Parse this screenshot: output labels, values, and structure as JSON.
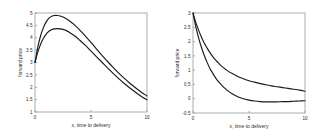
{
  "figure": {
    "background_color": "#ffffff",
    "axis_color": "#9a9a9a",
    "curve_color": "#1a1a1a",
    "panel_count": 2
  },
  "chart_data": [
    {
      "type": "line",
      "title": "",
      "xlabel": "x, time to delivery",
      "ylabel": "forward price",
      "xlim": [
        0,
        10
      ],
      "ylim": [
        1,
        5
      ],
      "xticks": [
        0,
        5,
        10
      ],
      "xticklabels": [
        "0",
        "5",
        "10"
      ],
      "yticks": [
        1,
        1.5,
        2,
        2.5,
        3,
        3.5,
        4,
        4.5,
        5
      ],
      "yticklabels": [
        "1",
        "1.5",
        "2",
        "2.5",
        "3",
        "3.5",
        "4",
        "4.5",
        "5"
      ],
      "grid": false,
      "legend": null,
      "x": [
        0,
        0.25,
        0.5,
        0.75,
        1,
        1.25,
        1.5,
        1.75,
        2,
        2.25,
        2.5,
        2.75,
        3,
        3.5,
        4,
        4.5,
        5,
        5.5,
        6,
        6.5,
        7,
        7.5,
        8,
        8.5,
        9,
        9.5,
        10
      ],
      "series": [
        {
          "name": "upper curve",
          "values": [
            3.0,
            3.62,
            4.08,
            4.41,
            4.64,
            4.79,
            4.87,
            4.9,
            4.9,
            4.88,
            4.84,
            4.78,
            4.71,
            4.53,
            4.31,
            4.07,
            3.81,
            3.54,
            3.28,
            3.03,
            2.79,
            2.56,
            2.35,
            2.15,
            1.97,
            1.8,
            1.65
          ]
        },
        {
          "name": "lower curve",
          "values": [
            3.0,
            3.42,
            3.74,
            3.98,
            4.15,
            4.26,
            4.33,
            4.36,
            4.37,
            4.36,
            4.34,
            4.3,
            4.24,
            4.09,
            3.9,
            3.69,
            3.46,
            3.23,
            3.0,
            2.77,
            2.55,
            2.34,
            2.14,
            1.96,
            1.79,
            1.63,
            1.49
          ]
        }
      ]
    },
    {
      "type": "line",
      "title": "",
      "xlabel": "x, time to delivery",
      "ylabel": "forward price",
      "xlim": [
        0,
        10
      ],
      "ylim": [
        -0.5,
        3
      ],
      "xticks": [
        0,
        5,
        10
      ],
      "xticklabels": [
        "0",
        "5",
        "10"
      ],
      "yticks": [
        -0.5,
        0,
        0.5,
        1,
        1.5,
        2,
        2.5,
        3
      ],
      "yticklabels": [
        "-0.5",
        "0",
        "0.5",
        "1",
        "1.5",
        "2",
        "2.5",
        "3"
      ],
      "grid": false,
      "legend": null,
      "x": [
        0,
        0.25,
        0.5,
        0.75,
        1,
        1.25,
        1.5,
        1.75,
        2,
        2.25,
        2.5,
        2.75,
        3,
        3.5,
        4,
        4.5,
        5,
        5.5,
        6,
        6.5,
        7,
        7.5,
        8,
        8.5,
        9,
        9.5,
        10
      ],
      "series": [
        {
          "name": "upper curve",
          "values": [
            3.0,
            2.67,
            2.4,
            2.16,
            1.95,
            1.78,
            1.62,
            1.48,
            1.36,
            1.26,
            1.16,
            1.08,
            1.0,
            0.88,
            0.78,
            0.7,
            0.63,
            0.58,
            0.53,
            0.49,
            0.45,
            0.42,
            0.39,
            0.36,
            0.33,
            0.3,
            0.26
          ]
        },
        {
          "name": "lower curve",
          "values": [
            3.0,
            2.52,
            2.13,
            1.8,
            1.52,
            1.28,
            1.07,
            0.9,
            0.74,
            0.61,
            0.5,
            0.4,
            0.31,
            0.17,
            0.07,
            0.0,
            -0.05,
            -0.08,
            -0.1,
            -0.11,
            -0.11,
            -0.11,
            -0.1,
            -0.1,
            -0.09,
            -0.08,
            -0.07
          ]
        }
      ]
    }
  ]
}
